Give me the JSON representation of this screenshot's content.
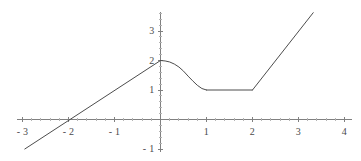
{
  "chart_data": {
    "type": "line",
    "title": "",
    "subtitle": "",
    "xlabel": "",
    "ylabel": "",
    "xlim": [
      -3.1,
      4.15
    ],
    "ylim": [
      -1.4,
      3.75
    ],
    "grid": false,
    "legend": null,
    "axis_color": "#808080",
    "curve_color": "#4d4d4d",
    "background": "#ffffff",
    "xticks": [
      -3,
      -2,
      -1,
      1,
      2,
      3,
      4
    ],
    "xtick_labels": [
      "- 3",
      "- 2",
      "- 1",
      "1",
      "2",
      "3",
      "4"
    ],
    "yticks": [
      -1,
      1,
      2,
      3
    ],
    "ytick_labels": [
      "- 1",
      "1",
      "2",
      "3"
    ],
    "minor_tick_step": 0.2,
    "series": [
      {
        "name": "piecewise-function",
        "segments": [
          {
            "name": "left-linear-ramp",
            "kind": "line",
            "points": [
              [
                -2.95,
                -1.0
              ],
              [
                0,
                2.0
              ]
            ]
          },
          {
            "name": "cosine-descent",
            "kind": "curve",
            "formula": "1 + cos(pi*x)/... smooth descent from (0,2) to (1,1)",
            "points": [
              [
                0.0,
                2.0
              ],
              [
                0.1,
                1.985
              ],
              [
                0.2,
                1.95
              ],
              [
                0.3,
                1.88
              ],
              [
                0.4,
                1.78
              ],
              [
                0.5,
                1.64
              ],
              [
                0.6,
                1.47
              ],
              [
                0.7,
                1.31
              ],
              [
                0.8,
                1.16
              ],
              [
                0.9,
                1.05
              ],
              [
                1.0,
                1.0
              ]
            ]
          },
          {
            "name": "flat-plateau",
            "kind": "line",
            "points": [
              [
                1.0,
                1.0
              ],
              [
                2.0,
                1.0
              ]
            ]
          },
          {
            "name": "right-linear-ramp",
            "kind": "line",
            "points": [
              [
                2.0,
                1.0
              ],
              [
                3.32,
                3.62
              ]
            ]
          }
        ]
      }
    ]
  },
  "axes": {
    "origin_px": {
      "x": 160.5,
      "y": 119.5
    },
    "scale_px_per_unit": {
      "x": 46.0,
      "y": 29.5
    },
    "x_axis_extent_px": [
      17,
      352
    ],
    "y_axis_extent_px": [
      12,
      152
    ]
  },
  "labels": {
    "x": [
      {
        "text": "- 3",
        "value": -3
      },
      {
        "text": "- 2",
        "value": -2
      },
      {
        "text": "- 1",
        "value": -1
      },
      {
        "text": "1",
        "value": 1
      },
      {
        "text": "2",
        "value": 2
      },
      {
        "text": "3",
        "value": 3
      },
      {
        "text": "4",
        "value": 4
      }
    ],
    "y": [
      {
        "text": "3",
        "value": 3
      },
      {
        "text": "2",
        "value": 2
      },
      {
        "text": "1",
        "value": 1
      },
      {
        "text": "- 1",
        "value": -1
      }
    ]
  }
}
